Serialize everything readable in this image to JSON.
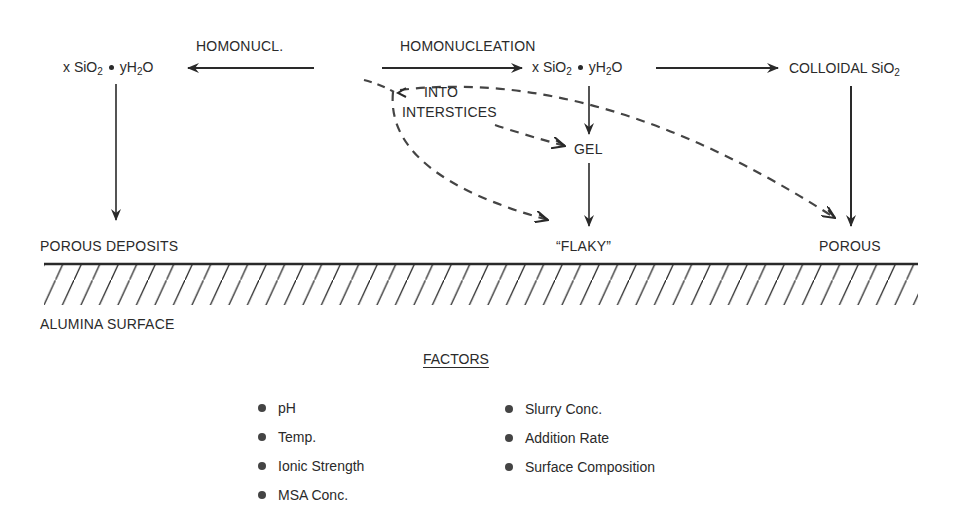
{
  "diagram": {
    "labels": {
      "homonucl_short": "HOMONUCL.",
      "homonucleation": "HOMONUCLEATION",
      "into": "INTO",
      "interstices": "INTERSTICES",
      "gel": "GEL",
      "colloidal": "COLLOIDAL SiO",
      "colloidal_sub": "2",
      "porous_deposits": "POROUS DEPOSITS",
      "flaky": "“FLAKY”",
      "porous": "POROUS",
      "alumina_surface": "ALUMINA SURFACE"
    },
    "formula_left": {
      "x": "x SiO",
      "sub1": "2",
      "y": "yH",
      "sub2": "2",
      "tail": "O"
    },
    "formula_mid": {
      "x": "x SiO",
      "sub1": "2",
      "y": "yH",
      "sub2": "2",
      "tail": "O"
    },
    "line_color": "#2a2a2a",
    "dash_color": "#444444"
  },
  "factors": {
    "title": "FACTORS",
    "left": [
      "pH",
      "Temp.",
      "Ionic Strength",
      "MSA Conc."
    ],
    "right": [
      "Slurry Conc.",
      "Addition Rate",
      "Surface Composition"
    ]
  }
}
